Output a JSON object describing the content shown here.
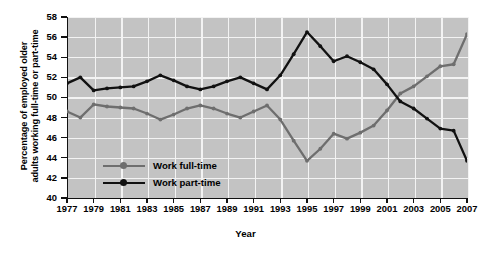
{
  "chart_data": {
    "type": "line",
    "title": "",
    "xlabel": "Year",
    "ylabel": "Percentage of employed older adults working full-time or part-time",
    "ylabel_line1": "Percentage of employed older",
    "ylabel_line2": "adults working full-time or part-time",
    "ylim": [
      40,
      58
    ],
    "yticks": [
      40,
      42,
      44,
      46,
      48,
      50,
      52,
      54,
      56,
      58
    ],
    "xlim": [
      1977,
      2007
    ],
    "xticks": [
      1977,
      1979,
      1981,
      1983,
      1985,
      1987,
      1989,
      1991,
      1993,
      1995,
      1997,
      1999,
      2001,
      2003,
      2005,
      2007
    ],
    "x": [
      1977,
      1978,
      1979,
      1980,
      1981,
      1982,
      1983,
      1984,
      1985,
      1986,
      1987,
      1988,
      1989,
      1990,
      1991,
      1992,
      1993,
      1994,
      1995,
      1996,
      1997,
      1998,
      1999,
      2000,
      2001,
      2002,
      2003,
      2004,
      2005,
      2006,
      2007
    ],
    "grid": true,
    "legend_position": "inside-bottom-left",
    "series": [
      {
        "name": "Work full-time",
        "color": "#6e6e6e",
        "values": [
          48.6,
          48.0,
          49.3,
          49.1,
          49.0,
          48.9,
          48.4,
          47.8,
          48.3,
          48.9,
          49.2,
          48.9,
          48.4,
          48.0,
          48.6,
          49.2,
          47.8,
          45.7,
          43.7,
          44.9,
          46.4,
          45.9,
          46.5,
          47.2,
          48.7,
          50.4,
          51.1,
          52.1,
          53.1,
          53.3,
          56.3
        ]
      },
      {
        "name": "Work part-time",
        "color": "#111111",
        "values": [
          51.4,
          52.0,
          50.7,
          50.9,
          51.0,
          51.1,
          51.6,
          52.2,
          51.7,
          51.1,
          50.8,
          51.1,
          51.6,
          52.0,
          51.4,
          50.8,
          52.2,
          54.3,
          56.5,
          55.1,
          53.6,
          54.1,
          53.5,
          52.8,
          51.3,
          49.6,
          48.9,
          47.9,
          46.9,
          46.7,
          43.7
        ]
      }
    ]
  },
  "legend": {
    "items": [
      {
        "label": "Work full-time"
      },
      {
        "label": "Work part-time"
      }
    ]
  },
  "axis": {
    "x_title": "Year"
  }
}
